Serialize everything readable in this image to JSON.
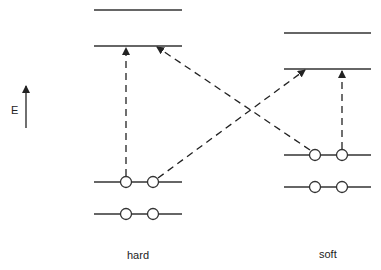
{
  "axis": {
    "label": "E",
    "direction": "up"
  },
  "columns": [
    {
      "id": "hard",
      "label": "hard",
      "x1": 94,
      "x2": 182,
      "levels": [
        10,
        46,
        182,
        214
      ],
      "electrons": [
        126,
        153
      ]
    },
    {
      "id": "soft",
      "label": "soft",
      "x1": 284,
      "x2": 371,
      "levels": [
        33,
        69,
        155,
        187
      ],
      "electrons": [
        315,
        342
      ]
    }
  ],
  "transitions": [
    {
      "from": "hard HOMO",
      "to": "hard LUMO",
      "type": "dashed-arrow"
    },
    {
      "from": "hard HOMO",
      "to": "soft LUMO",
      "type": "dashed-arrow"
    },
    {
      "from": "soft HOMO",
      "to": "hard LUMO",
      "type": "dashed-arrow"
    },
    {
      "from": "soft HOMO",
      "to": "soft LUMO",
      "type": "dashed-arrow"
    }
  ],
  "colors": {
    "line": "#333333",
    "background": "#ffffff"
  }
}
